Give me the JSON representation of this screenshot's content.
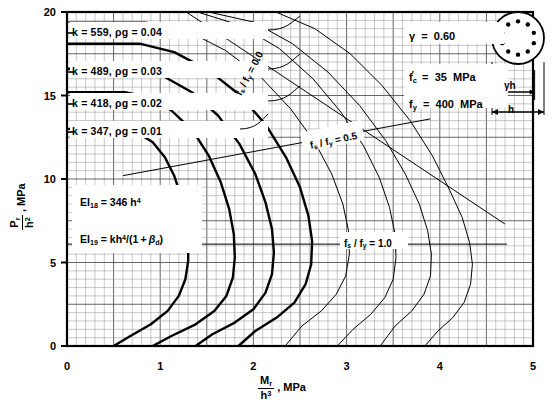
{
  "chart_data": {
    "type": "line",
    "title": "",
    "xlabel": "Mr / h3 , MPa",
    "ylabel": "Pr / h2 , MPa",
    "xlim": [
      0,
      5
    ],
    "ylim": [
      0,
      20
    ],
    "xticks": [
      "0",
      "1",
      "2",
      "3",
      "4",
      "5"
    ],
    "yticks": [
      "0",
      "5",
      "10",
      "15",
      "20"
    ],
    "grid": true,
    "legend_position": "inside-plot",
    "series": [
      {
        "name": "rho_g = 0.01, k = 347",
        "label": "k  =  347,  ρg = 0.01",
        "weight": "thick",
        "points": [
          [
            0,
            13.0
          ],
          [
            0.55,
            13.0
          ],
          [
            0.75,
            12.8
          ],
          [
            0.92,
            12.2
          ],
          [
            1.05,
            11.3
          ],
          [
            1.15,
            10.2
          ],
          [
            1.22,
            9.0
          ],
          [
            1.27,
            7.7
          ],
          [
            1.3,
            6.4
          ],
          [
            1.3,
            5.1
          ],
          [
            1.27,
            4.0
          ],
          [
            1.2,
            3.0
          ],
          [
            1.08,
            2.1
          ],
          [
            0.9,
            1.3
          ],
          [
            0.68,
            0.6
          ],
          [
            0.5,
            0.0
          ]
        ]
      },
      {
        "name": "rho_g = 0.02, k = 418",
        "label": "k  =  418,  ρg = 0.02",
        "weight": "thick",
        "points": [
          [
            0,
            15.2
          ],
          [
            0.62,
            15.2
          ],
          [
            0.88,
            14.9
          ],
          [
            1.12,
            14.1
          ],
          [
            1.35,
            12.9
          ],
          [
            1.52,
            11.4
          ],
          [
            1.65,
            9.8
          ],
          [
            1.74,
            8.2
          ],
          [
            1.79,
            6.7
          ],
          [
            1.8,
            5.3
          ],
          [
            1.78,
            4.1
          ],
          [
            1.71,
            3.0
          ],
          [
            1.58,
            2.1
          ],
          [
            1.38,
            1.3
          ],
          [
            1.12,
            0.6
          ],
          [
            0.92,
            0.0
          ]
        ]
      },
      {
        "name": "rho_g = 0.03, k = 489",
        "label": "k  =  489,  ρg = 0.03",
        "weight": "thick",
        "points": [
          [
            0,
            16.6
          ],
          [
            0.7,
            16.6
          ],
          [
            1.02,
            16.2
          ],
          [
            1.34,
            15.2
          ],
          [
            1.62,
            13.8
          ],
          [
            1.85,
            12.1
          ],
          [
            2.02,
            10.3
          ],
          [
            2.13,
            8.6
          ],
          [
            2.2,
            7.0
          ],
          [
            2.22,
            5.6
          ],
          [
            2.2,
            4.3
          ],
          [
            2.13,
            3.2
          ],
          [
            2.0,
            2.2
          ],
          [
            1.8,
            1.4
          ],
          [
            1.56,
            0.7
          ],
          [
            1.38,
            0.0
          ]
        ]
      },
      {
        "name": "rho_g = 0.04, k = 559",
        "label": "k  =  559,  ρg = 0.04",
        "weight": "thick",
        "points": [
          [
            0,
            18.1
          ],
          [
            0.78,
            18.1
          ],
          [
            1.15,
            17.6
          ],
          [
            1.52,
            16.5
          ],
          [
            1.86,
            15.0
          ],
          [
            2.14,
            13.2
          ],
          [
            2.35,
            11.3
          ],
          [
            2.5,
            9.5
          ],
          [
            2.59,
            7.8
          ],
          [
            2.63,
            6.3
          ],
          [
            2.62,
            4.9
          ],
          [
            2.56,
            3.7
          ],
          [
            2.44,
            2.6
          ],
          [
            2.25,
            1.7
          ],
          [
            2.02,
            0.9
          ],
          [
            1.84,
            0.0
          ]
        ]
      },
      {
        "name": "rho_g = 0.05",
        "weight": "thin",
        "points": [
          [
            0,
            19.4
          ],
          [
            0.85,
            19.4
          ],
          [
            1.28,
            18.9
          ],
          [
            1.7,
            17.7
          ],
          [
            2.08,
            16.1
          ],
          [
            2.4,
            14.2
          ],
          [
            2.66,
            12.2
          ],
          [
            2.84,
            10.3
          ],
          [
            2.96,
            8.5
          ],
          [
            3.02,
            6.9
          ],
          [
            3.03,
            5.5
          ],
          [
            2.99,
            4.2
          ],
          [
            2.89,
            3.1
          ],
          [
            2.73,
            2.1
          ],
          [
            2.52,
            1.2
          ],
          [
            2.34,
            0.0
          ]
        ]
      },
      {
        "name": "rho_g = 0.06",
        "weight": "thin",
        "points": [
          [
            0,
            20.0
          ],
          [
            1.4,
            20.0
          ],
          [
            1.86,
            19.2
          ],
          [
            2.28,
            17.8
          ],
          [
            2.64,
            16.0
          ],
          [
            2.94,
            14.0
          ],
          [
            3.18,
            12.0
          ],
          [
            3.35,
            10.1
          ],
          [
            3.46,
            8.3
          ],
          [
            3.52,
            6.7
          ],
          [
            3.53,
            5.3
          ],
          [
            3.5,
            4.0
          ],
          [
            3.41,
            2.9
          ],
          [
            3.26,
            1.9
          ],
          [
            3.07,
            1.0
          ],
          [
            2.9,
            0.0
          ]
        ]
      },
      {
        "name": "rho_g = 0.07",
        "weight": "thin",
        "points": [
          [
            1.52,
            20.0
          ],
          [
            2.0,
            19.4
          ],
          [
            2.42,
            18.1
          ],
          [
            2.8,
            16.4
          ],
          [
            3.14,
            14.4
          ],
          [
            3.42,
            12.3
          ],
          [
            3.63,
            10.3
          ],
          [
            3.78,
            8.5
          ],
          [
            3.87,
            6.9
          ],
          [
            3.91,
            5.5
          ],
          [
            3.9,
            4.2
          ],
          [
            3.83,
            3.1
          ],
          [
            3.7,
            2.1
          ],
          [
            3.52,
            1.2
          ],
          [
            3.36,
            0.0
          ]
        ]
      },
      {
        "name": "rho_g = 0.08",
        "weight": "thin",
        "points": [
          [
            2.24,
            20.0
          ],
          [
            2.66,
            19.0
          ],
          [
            3.04,
            17.5
          ],
          [
            3.38,
            15.6
          ],
          [
            3.68,
            13.5
          ],
          [
            3.92,
            11.4
          ],
          [
            4.1,
            9.4
          ],
          [
            4.24,
            7.7
          ],
          [
            4.32,
            6.2
          ],
          [
            4.35,
            4.9
          ],
          [
            4.33,
            3.7
          ],
          [
            4.26,
            2.6
          ],
          [
            4.14,
            1.7
          ],
          [
            3.98,
            0.9
          ],
          [
            3.84,
            0.0
          ]
        ]
      }
    ],
    "radial_lines": [
      {
        "label": "fs / fy = 0.0",
        "from": [
          1.28,
          20.0
        ],
        "to": [
          4.7,
          7.3
        ]
      },
      {
        "label": "fs / fy = 0.5",
        "from": [
          0.6,
          10.2
        ],
        "to": [
          3.9,
          13.6
        ]
      },
      {
        "label": "fs / fy = 1.0",
        "from": [
          0.0,
          6.1
        ],
        "to": [
          4.72,
          6.1
        ]
      }
    ]
  },
  "kboxes": [
    {
      "text": "k  =  559,  ρg = 0.04"
    },
    {
      "text": "k  =  489,  ρg = 0.03"
    },
    {
      "text": "k  =  418,  ρg = 0.02"
    },
    {
      "text": "k  =  347,  ρg = 0.01"
    }
  ],
  "parameters": [
    {
      "symbol": "γ",
      "eq": "=",
      "value": "0.60",
      "unit": ""
    },
    {
      "symbol": "fc",
      "eq": "=",
      "value": "35",
      "unit": "MPa"
    },
    {
      "symbol": "fy",
      "eq": "=",
      "value": "400",
      "unit": "MPa"
    }
  ],
  "ei_notes": [
    {
      "text": "EI18  =  346 h 4"
    },
    {
      "text": "EI19  =  kh 4/(1 + βd)"
    }
  ],
  "radial_labels": {
    "zero": "fs / fy = 0.0",
    "half": "fs / fy = 0.5",
    "one": "fs / fy = 1.0"
  },
  "section_diagram": {
    "name": "circular-column-section",
    "bar_count": 10,
    "dim_inner": "γh",
    "dim_outer": "h"
  },
  "axes": {
    "x_numerator": "Mr",
    "x_denominator": "h3",
    "x_unit": ", MPa",
    "y_numerator": "Pr",
    "y_denominator": "h2",
    "y_unit": ", MPa",
    "xticks": [
      "0",
      "1",
      "2",
      "3",
      "4",
      "5"
    ],
    "yticks": [
      "0",
      "5",
      "10",
      "15",
      "20"
    ]
  },
  "colors": {
    "ink": "#000000",
    "grid_minor": "#8d8d8d",
    "grid_major": "#4a4a4a",
    "paper": "#ffffff"
  }
}
